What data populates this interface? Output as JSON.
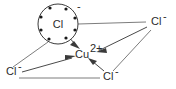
{
  "diagram": {
    "background_color": "#ffffff",
    "line_color": "#7d7d7d",
    "arrow_color": "#3a3a3a",
    "text_color": "#2b2b2b",
    "central_ion": {
      "symbol": "Cu",
      "charge": "2+",
      "full_label": "Cu2+",
      "x": 84,
      "y": 54
    },
    "lewis_species": {
      "symbol": "Cl",
      "charge": "-",
      "full_label": "Cl-",
      "electron_dot_count": 8,
      "circle_center_x": 58,
      "circle_center_y": 24,
      "circle_radius": 20
    },
    "ligands": [
      {
        "id": "chloride-top-right",
        "symbol": "Cl",
        "charge": "-",
        "full_label": "Cl-",
        "x": 153,
        "y": 22,
        "position": "top-right"
      },
      {
        "id": "chloride-bottom-left",
        "symbol": "Cl",
        "charge": "-",
        "full_label": "Cl-",
        "x": 10,
        "y": 71,
        "position": "bottom-left"
      },
      {
        "id": "chloride-bottom-center",
        "symbol": "Cl",
        "charge": "-",
        "full_label": "Cl-",
        "x": 107,
        "y": 76,
        "position": "bottom-center"
      }
    ],
    "electron_dots": [
      {
        "x": 50,
        "y": 8
      },
      {
        "x": 66,
        "y": 9
      },
      {
        "x": 41,
        "y": 17
      },
      {
        "x": 75,
        "y": 18
      },
      {
        "x": 41,
        "y": 30
      },
      {
        "x": 75,
        "y": 30
      },
      {
        "x": 49,
        "y": 39
      },
      {
        "x": 66,
        "y": 38
      }
    ],
    "dative_arrows": [
      {
        "id": "arrow-lewis-chloride-to-copper",
        "from": "lewis-chloride",
        "to": "copper",
        "x1": 62,
        "y1": 30,
        "x2": 78,
        "y2": 47
      },
      {
        "id": "arrow-bottom-left-chloride-to-copper",
        "from": "chloride-bottom-left",
        "to": "copper",
        "x1": 22,
        "y1": 72,
        "x2": 74,
        "y2": 57
      },
      {
        "id": "arrow-top-right-chloride-to-copper",
        "from": "chloride-top-right",
        "to": "copper",
        "x1": 147,
        "y1": 27,
        "x2": 97,
        "y2": 50
      },
      {
        "id": "arrow-bottom-center-chloride-to-copper",
        "from": "chloride-bottom-center",
        "to": "copper",
        "x1": 104,
        "y1": 70,
        "x2": 90,
        "y2": 59
      }
    ],
    "plain_lines": [
      {
        "id": "line-lewis-chloride-to-top-right-chloride",
        "x1": 78,
        "y1": 24,
        "x2": 146,
        "y2": 22
      },
      {
        "id": "line-lewis-chloride-to-bottom-left-chloride",
        "x1": 48,
        "y1": 42,
        "x2": 13,
        "y2": 67
      },
      {
        "id": "line-bottom-left-chloride-to-bottom-center-chloride",
        "x1": 19,
        "y1": 78,
        "x2": 100,
        "y2": 78
      },
      {
        "id": "line-top-right-chloride-to-bottom-center-chloride",
        "x1": 151,
        "y1": 30,
        "x2": 113,
        "y2": 71
      }
    ]
  }
}
